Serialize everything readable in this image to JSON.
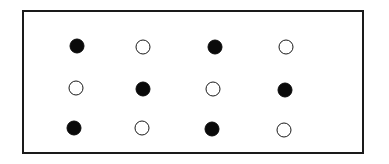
{
  "diagram": {
    "type": "dot-grid",
    "rows": 3,
    "cols": 4,
    "frame": {
      "border_color": "#1a1a1a",
      "fill": "#ffffff"
    },
    "colors": {
      "filled": "#0a0a0a",
      "open_stroke": "#1a1a1a",
      "open_fill": "#ffffff"
    },
    "grid": [
      [
        "filled",
        "open",
        "filled",
        "open"
      ],
      [
        "open",
        "filled",
        "open",
        "filled"
      ],
      [
        "filled",
        "open",
        "filled",
        "open"
      ]
    ],
    "dots": [
      {
        "row": 0,
        "col": 0,
        "state": "filled",
        "x": 77,
        "y": 46
      },
      {
        "row": 0,
        "col": 1,
        "state": "open",
        "x": 143,
        "y": 47
      },
      {
        "row": 0,
        "col": 2,
        "state": "filled",
        "x": 215,
        "y": 47
      },
      {
        "row": 0,
        "col": 3,
        "state": "open",
        "x": 286,
        "y": 47
      },
      {
        "row": 1,
        "col": 0,
        "state": "open",
        "x": 76,
        "y": 88
      },
      {
        "row": 1,
        "col": 1,
        "state": "filled",
        "x": 143,
        "y": 89
      },
      {
        "row": 1,
        "col": 2,
        "state": "open",
        "x": 213,
        "y": 89
      },
      {
        "row": 1,
        "col": 3,
        "state": "filled",
        "x": 285,
        "y": 90
      },
      {
        "row": 2,
        "col": 0,
        "state": "filled",
        "x": 74,
        "y": 128
      },
      {
        "row": 2,
        "col": 1,
        "state": "open",
        "x": 142,
        "y": 128
      },
      {
        "row": 2,
        "col": 2,
        "state": "filled",
        "x": 212,
        "y": 129
      },
      {
        "row": 2,
        "col": 3,
        "state": "open",
        "x": 284,
        "y": 130
      }
    ]
  }
}
